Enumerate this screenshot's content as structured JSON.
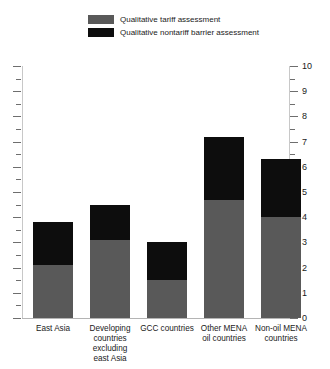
{
  "chart_data": {
    "type": "bar",
    "stacked": true,
    "title": "",
    "subtitle": "",
    "xlabel": "",
    "ylabel": "",
    "ylim": [
      0,
      10
    ],
    "y_ticks": [
      0,
      1,
      2,
      3,
      4,
      5,
      6,
      7,
      8,
      9,
      10
    ],
    "y_tick_labels": [
      "0",
      "1",
      "2",
      "3",
      "4",
      "5",
      "6",
      "7",
      "8",
      "9",
      "10"
    ],
    "y_minor_ticks": [
      0.5,
      1.5,
      2.5,
      3.5,
      4.5,
      5.5,
      6.5,
      7.5,
      8.5,
      9.5
    ],
    "grid": false,
    "axis_position": "both",
    "left_axis_labeled": false,
    "right_axis_labeled": true,
    "legend_position": "top",
    "categories": [
      "East Asia",
      "Developing countries excluding east Asia",
      "GCC countries",
      "Other MENA oil countries",
      "Non-oil MENA countries"
    ],
    "category_label_lines": [
      [
        "East Asia"
      ],
      [
        "Developing",
        "countries",
        "excluding",
        "east Asia"
      ],
      [
        "GCC countries"
      ],
      [
        "Other MENA",
        "oil countries"
      ],
      [
        "Non-oil MENA",
        "countries"
      ]
    ],
    "series": [
      {
        "name": "Qualitative tariff assessment",
        "color": "#595959",
        "values": [
          2.1,
          3.1,
          1.5,
          4.7,
          4.0
        ]
      },
      {
        "name": "Qualitative nontariff barrier assessment",
        "color": "#0d0d0d",
        "values": [
          1.7,
          1.4,
          1.5,
          2.5,
          2.3
        ]
      }
    ],
    "totals": [
      3.8,
      4.5,
      3.0,
      7.2,
      6.3
    ]
  },
  "legend": {
    "items": [
      {
        "label": "Qualitative tariff assessment",
        "color": "#595959"
      },
      {
        "label": "Qualitative nontariff barrier assessment",
        "color": "#0d0d0d"
      }
    ]
  },
  "colors": {
    "tariff": "#595959",
    "nontariff": "#0d0d0d",
    "axis": "#c8c8c8",
    "tick": "#6e6e6e",
    "text": "#1a1a1a",
    "background": "#ffffff"
  }
}
